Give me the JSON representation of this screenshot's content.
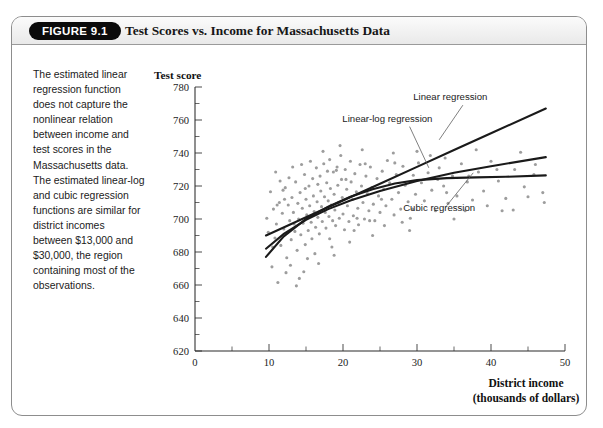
{
  "figure": {
    "badge": "FIGURE 9.1",
    "title": "Test Scores vs. Income for Massachusetts Data",
    "caption": "The estimated linear regression function does not capture the nonlinear relation between income and test scores in the Massachusetts data. The estimated linear-log and cubic regression functions are similar for district incomes between $13,000 and $30,000, the region containing most of the observations."
  },
  "chart_data": {
    "type": "scatter",
    "title": "Test Scores vs. Income for Massachusetts Data",
    "ylabel": "Test score",
    "xlabel": "District income",
    "xlabel_sub": "(thousands of dollars)",
    "xlim": [
      0,
      50
    ],
    "ylim": [
      620,
      780
    ],
    "xticks": [
      0,
      10,
      20,
      30,
      40,
      50
    ],
    "yticks": [
      620,
      640,
      660,
      680,
      700,
      720,
      740,
      760,
      780
    ],
    "xminor_step": 5,
    "yminor_step": 10,
    "grid": false,
    "point_color": "#9d9d9d",
    "curve_color": "#1a1a1a",
    "annotations": [
      {
        "label": "Linear regression",
        "x": 34.5,
        "y": 772
      },
      {
        "label": "Linear-log regression",
        "x": 26.0,
        "y": 759
      },
      {
        "label": "Cubic regression",
        "x": 33.0,
        "y": 705
      }
    ],
    "series": [
      {
        "name": "Linear regression",
        "type": "line",
        "points": [
          [
            9.6,
            690.0
          ],
          [
            15.0,
            701.0
          ],
          [
            20.0,
            711.2
          ],
          [
            25.0,
            721.4
          ],
          [
            30.0,
            731.6
          ],
          [
            35.0,
            741.8
          ],
          [
            40.0,
            752.0
          ],
          [
            47.4,
            767.0
          ]
        ]
      },
      {
        "name": "Linear-log regression",
        "type": "line",
        "points": [
          [
            9.6,
            682.0
          ],
          [
            12.0,
            691.0
          ],
          [
            15.0,
            699.5
          ],
          [
            18.0,
            706.0
          ],
          [
            21.0,
            711.3
          ],
          [
            25.0,
            717.0
          ],
          [
            30.0,
            723.0
          ],
          [
            35.0,
            728.0
          ],
          [
            40.0,
            732.0
          ],
          [
            47.4,
            737.5
          ]
        ]
      },
      {
        "name": "Cubic regression",
        "type": "line",
        "points": [
          [
            9.6,
            677.0
          ],
          [
            12.0,
            689.5
          ],
          [
            15.0,
            700.0
          ],
          [
            18.0,
            707.5
          ],
          [
            21.0,
            713.5
          ],
          [
            24.0,
            718.0
          ],
          [
            27.0,
            721.5
          ],
          [
            30.0,
            723.6
          ],
          [
            34.0,
            724.8
          ],
          [
            38.0,
            725.2
          ],
          [
            42.0,
            725.6
          ],
          [
            47.4,
            726.4
          ]
        ]
      },
      {
        "name": "Massachusetts districts",
        "type": "scatter",
        "points": [
          [
            9.7,
            700.5
          ],
          [
            9.9,
            692.0
          ],
          [
            10.2,
            716.5
          ],
          [
            10.4,
            671.0
          ],
          [
            10.6,
            706.0
          ],
          [
            10.8,
            688.5
          ],
          [
            11.0,
            697.0
          ],
          [
            11.2,
            661.5
          ],
          [
            11.4,
            710.0
          ],
          [
            11.6,
            684.0
          ],
          [
            11.8,
            703.5
          ],
          [
            12.0,
            694.0
          ],
          [
            12.2,
            719.0
          ],
          [
            12.4,
            676.5
          ],
          [
            12.6,
            708.5
          ],
          [
            12.8,
            699.0
          ],
          [
            13.0,
            687.5
          ],
          [
            13.1,
            713.0
          ],
          [
            13.3,
            704.0
          ],
          [
            13.5,
            692.5
          ],
          [
            13.6,
            722.5
          ],
          [
            13.8,
            681.0
          ],
          [
            13.9,
            709.5
          ],
          [
            14.0,
            700.0
          ],
          [
            14.2,
            716.0
          ],
          [
            14.3,
            690.5
          ],
          [
            14.5,
            706.5
          ],
          [
            14.6,
            697.5
          ],
          [
            14.8,
            727.0
          ],
          [
            14.9,
            684.5
          ],
          [
            15.0,
            712.0
          ],
          [
            15.1,
            702.5
          ],
          [
            15.3,
            693.0
          ],
          [
            15.4,
            720.0
          ],
          [
            15.5,
            708.0
          ],
          [
            15.7,
            698.0
          ],
          [
            15.8,
            688.0
          ],
          [
            15.9,
            724.5
          ],
          [
            16.0,
            714.0
          ],
          [
            16.1,
            704.5
          ],
          [
            16.3,
            695.0
          ],
          [
            16.4,
            731.0
          ],
          [
            16.5,
            710.5
          ],
          [
            16.6,
            701.0
          ],
          [
            16.8,
            691.0
          ],
          [
            16.9,
            726.0
          ],
          [
            17.0,
            717.0
          ],
          [
            17.1,
            707.5
          ],
          [
            17.2,
            698.5
          ],
          [
            17.4,
            733.5
          ],
          [
            17.5,
            713.5
          ],
          [
            17.6,
            704.0
          ],
          [
            17.7,
            694.5
          ],
          [
            17.8,
            722.0
          ],
          [
            18.0,
            711.0
          ],
          [
            18.1,
            701.5
          ],
          [
            18.2,
            736.0
          ],
          [
            18.3,
            718.5
          ],
          [
            18.4,
            708.5
          ],
          [
            18.6,
            699.0
          ],
          [
            18.7,
            728.5
          ],
          [
            18.8,
            715.0
          ],
          [
            18.9,
            705.5
          ],
          [
            19.0,
            696.0
          ],
          [
            19.2,
            731.5
          ],
          [
            19.3,
            720.5
          ],
          [
            19.4,
            710.0
          ],
          [
            19.5,
            700.5
          ],
          [
            19.7,
            738.5
          ],
          [
            19.8,
            724.0
          ],
          [
            19.9,
            713.0
          ],
          [
            20.0,
            703.0
          ],
          [
            20.2,
            693.5
          ],
          [
            20.3,
            730.0
          ],
          [
            20.5,
            718.0
          ],
          [
            20.6,
            708.0
          ],
          [
            20.8,
            698.5
          ],
          [
            21.0,
            735.0
          ],
          [
            21.1,
            722.5
          ],
          [
            21.3,
            712.0
          ],
          [
            21.4,
            702.0
          ],
          [
            21.6,
            727.5
          ],
          [
            21.8,
            716.5
          ],
          [
            22.0,
            706.5
          ],
          [
            22.1,
            696.5
          ],
          [
            22.3,
            733.0
          ],
          [
            22.5,
            720.0
          ],
          [
            22.7,
            710.0
          ],
          [
            22.9,
            700.0
          ],
          [
            23.1,
            726.0
          ],
          [
            23.3,
            715.5
          ],
          [
            23.5,
            705.0
          ],
          [
            23.7,
            731.5
          ],
          [
            23.9,
            719.0
          ],
          [
            24.1,
            709.0
          ],
          [
            24.3,
            699.0
          ],
          [
            24.6,
            724.5
          ],
          [
            24.8,
            714.0
          ],
          [
            25.0,
            704.0
          ],
          [
            25.3,
            729.0
          ],
          [
            25.5,
            718.0
          ],
          [
            25.8,
            708.0
          ],
          [
            26.0,
            735.5
          ],
          [
            26.3,
            722.0
          ],
          [
            26.6,
            712.0
          ],
          [
            26.9,
            702.5
          ],
          [
            27.2,
            727.0
          ],
          [
            27.5,
            716.0
          ],
          [
            27.8,
            706.0
          ],
          [
            28.1,
            732.0
          ],
          [
            28.4,
            720.5
          ],
          [
            28.8,
            710.5
          ],
          [
            29.1,
            700.5
          ],
          [
            29.5,
            726.5
          ],
          [
            29.8,
            715.0
          ],
          [
            30.2,
            734.0
          ],
          [
            30.6,
            722.0
          ],
          [
            31.0,
            711.0
          ],
          [
            31.5,
            728.0
          ],
          [
            32.0,
            717.5
          ],
          [
            32.5,
            705.0
          ],
          [
            33.0,
            731.0
          ],
          [
            33.6,
            720.0
          ],
          [
            34.2,
            709.5
          ],
          [
            34.8,
            726.0
          ],
          [
            35.4,
            714.0
          ],
          [
            36.0,
            733.5
          ],
          [
            36.8,
            722.5
          ],
          [
            37.5,
            711.5
          ],
          [
            38.3,
            728.5
          ],
          [
            39.0,
            717.0
          ],
          [
            40.0,
            735.0
          ],
          [
            41.0,
            723.0
          ],
          [
            42.0,
            712.5
          ],
          [
            43.2,
            730.0
          ],
          [
            44.5,
            719.5
          ],
          [
            45.8,
            727.0
          ],
          [
            47.0,
            716.0
          ],
          [
            11.5,
            723.0
          ],
          [
            12.3,
            667.5
          ],
          [
            13.2,
            731.5
          ],
          [
            14.1,
            664.0
          ],
          [
            12.9,
            672.0
          ],
          [
            15.6,
            735.0
          ],
          [
            16.2,
            679.0
          ],
          [
            17.3,
            741.0
          ],
          [
            18.5,
            683.0
          ],
          [
            19.6,
            744.5
          ],
          [
            20.9,
            686.0
          ],
          [
            22.6,
            742.0
          ],
          [
            24.0,
            690.0
          ],
          [
            26.8,
            740.0
          ],
          [
            29.0,
            693.0
          ],
          [
            31.8,
            738.5
          ],
          [
            35.0,
            700.0
          ],
          [
            38.0,
            742.0
          ],
          [
            41.5,
            705.0
          ],
          [
            44.0,
            740.5
          ],
          [
            13.7,
            659.5
          ],
          [
            14.7,
            668.0
          ],
          [
            15.2,
            676.0
          ],
          [
            16.7,
            673.0
          ],
          [
            18.8,
            678.0
          ],
          [
            10.9,
            728.5
          ],
          [
            11.9,
            717.5
          ],
          [
            12.7,
            725.0
          ],
          [
            14.4,
            733.0
          ],
          [
            17.9,
            729.0
          ],
          [
            21.5,
            693.0
          ],
          [
            23.0,
            733.5
          ],
          [
            25.6,
            696.0
          ],
          [
            28.0,
            698.0
          ],
          [
            30.0,
            741.0
          ],
          [
            33.8,
            737.0
          ],
          [
            39.5,
            708.0
          ],
          [
            46.0,
            733.0
          ],
          [
            47.2,
            710.0
          ],
          [
            43.0,
            705.5
          ],
          [
            10.5,
            683.0
          ],
          [
            11.1,
            708.5
          ],
          [
            12.1,
            712.0
          ],
          [
            13.4,
            697.0
          ],
          [
            14.9,
            718.5
          ],
          [
            16.6,
            721.0
          ],
          [
            18.2,
            688.0
          ],
          [
            19.1,
            729.5
          ],
          [
            20.4,
            724.0
          ],
          [
            21.9,
            700.5
          ],
          [
            23.6,
            699.0
          ],
          [
            25.2,
            712.0
          ],
          [
            27.0,
            734.0
          ],
          [
            29.4,
            706.0
          ],
          [
            32.8,
            724.0
          ],
          [
            36.5,
            705.0
          ],
          [
            40.8,
            730.0
          ],
          [
            45.0,
            713.5
          ],
          [
            34.0,
            716.0
          ],
          [
            37.0,
            726.0
          ]
        ]
      }
    ]
  }
}
